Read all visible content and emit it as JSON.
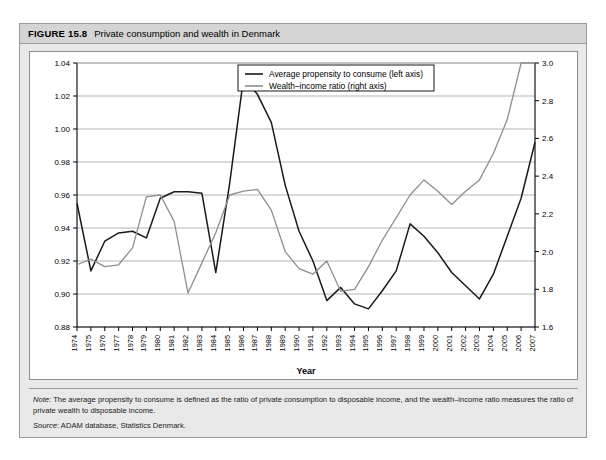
{
  "figure": {
    "label": "FIGURE 15.8",
    "title": "Private consumption and wealth in Denmark"
  },
  "notes": {
    "note_prefix": "Note",
    "note_text": ": The average propensity to consume is defined as the ratio of private consumption to disposable income, and the wealth–income ratio measures the ratio of private wealth to disposable income.",
    "source_prefix": "Source",
    "source_text": ": ADAM database, Statistics Denmark."
  },
  "chart_data": {
    "type": "line",
    "title": "Private consumption and wealth in Denmark",
    "xlabel": "Year",
    "ylabel": "",
    "grid": true,
    "legend_position": "top-center",
    "colors": {
      "series1": "#1a1a1a",
      "series2": "#8e8e8e",
      "grid": "#9a9a9a",
      "frame": "#000000"
    },
    "axes": {
      "left": {
        "label": "",
        "min": 0.88,
        "max": 1.04,
        "step": 0.02,
        "ticks": [
          "0.88",
          "0.90",
          "0.92",
          "0.94",
          "0.96",
          "0.98",
          "1.00",
          "1.02",
          "1.04"
        ]
      },
      "right": {
        "label": "",
        "min": 1.6,
        "max": 3.0,
        "step": 0.2,
        "ticks": [
          "1.6",
          "1.8",
          "2.0",
          "2.2",
          "2.4",
          "2.6",
          "2.8",
          "3.0"
        ]
      }
    },
    "categories": [
      "1974",
      "1975",
      "1976",
      "1977",
      "1978",
      "1979",
      "1980",
      "1981",
      "1982",
      "1983",
      "1984",
      "1985",
      "1986",
      "1987",
      "1988",
      "1989",
      "1990",
      "1991",
      "1992",
      "1993",
      "1994",
      "1995",
      "1996",
      "1997",
      "1998",
      "1999",
      "2000",
      "2001",
      "2002",
      "2003",
      "2004",
      "2005",
      "2006",
      "2007"
    ],
    "series": [
      {
        "name": "Average propensity to consume (left axis)",
        "axis": "left",
        "color": "#1a1a1a",
        "values": [
          0.955,
          0.914,
          0.932,
          0.937,
          0.938,
          0.934,
          0.958,
          0.962,
          0.962,
          0.961,
          0.913,
          0.967,
          1.031,
          1.021,
          1.004,
          0.966,
          0.938,
          0.92,
          0.896,
          0.904,
          0.894,
          0.891,
          0.902,
          0.914,
          0.9425,
          0.935,
          0.925,
          0.913,
          0.905,
          0.897,
          0.912,
          0.935,
          0.958,
          0.992
        ]
      },
      {
        "name": "Wealth–income ratio (right axis)",
        "axis": "right",
        "color": "#8e8e8e",
        "values": [
          1.93,
          1.96,
          1.92,
          1.93,
          2.02,
          2.29,
          2.3,
          2.16,
          1.78,
          1.94,
          2.1,
          2.3,
          2.32,
          2.33,
          2.22,
          2.0,
          1.91,
          1.88,
          1.95,
          1.79,
          1.8,
          1.92,
          2.06,
          2.18,
          2.3,
          2.38,
          2.32,
          2.25,
          2.32,
          2.38,
          2.52,
          2.7,
          3.0,
          3.0
        ]
      }
    ]
  }
}
